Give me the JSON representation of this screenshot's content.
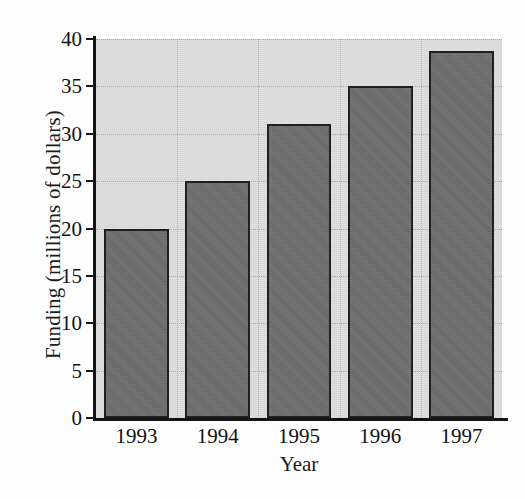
{
  "chart_data": {
    "type": "bar",
    "title": "",
    "xlabel": "Year",
    "ylabel": "Funding (millions of dollars)",
    "categories": [
      "1993",
      "1994",
      "1995",
      "1996",
      "1997"
    ],
    "values": [
      20,
      25,
      31,
      35,
      38.7
    ],
    "ylim": [
      0,
      40
    ],
    "yticks": [
      "0",
      "5",
      "10",
      "15",
      "20",
      "25",
      "30",
      "35",
      "40"
    ],
    "ytick_values": [
      0,
      5,
      10,
      15,
      20,
      25,
      30,
      35,
      40
    ],
    "grid": "dotted-both-axes",
    "legend": "none",
    "series": [
      {
        "name": "Funding",
        "values": [
          20,
          25,
          31,
          35,
          38.7
        ]
      }
    ],
    "colors": {
      "bar_fill": "#6e6e6e",
      "bar_outline": "#1c1c1c",
      "plot_background": "#dedede",
      "page_background": "#fdfdfd",
      "axis": "#141414",
      "gridline": "#9a9a9a",
      "text": "#111111"
    }
  }
}
